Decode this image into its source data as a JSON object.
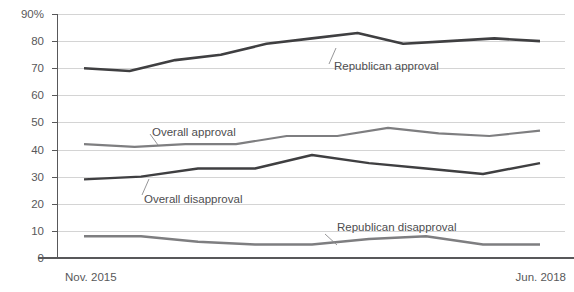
{
  "chart_data": {
    "type": "line",
    "title": "",
    "subtitle": "",
    "xlabel": "",
    "ylabel": "",
    "ylim": [
      0,
      90
    ],
    "yticks": [
      0,
      10,
      20,
      30,
      40,
      50,
      60,
      70,
      80,
      90
    ],
    "ytick_labels": [
      "0",
      "10",
      "20",
      "30",
      "40",
      "50",
      "60",
      "70",
      "80",
      "90%"
    ],
    "xtick_labels": [
      "Nov. 2015",
      "Jun. 2018"
    ],
    "x_range_start": "Nov. 2015",
    "x_range_end": "Jun. 2018",
    "grid": true,
    "legend_position": "inline-annotations",
    "colors": {
      "dark_series": "#3f3f41",
      "gray_series": "#7e7e80",
      "gridline": "#c9c9c9",
      "axis": "#58585a",
      "text": "#58585a"
    },
    "series": [
      {
        "name": "Republican approval",
        "color": "#3f3f41",
        "style": "dark",
        "values": [
          70,
          69,
          73,
          75,
          79,
          81,
          83,
          79,
          80,
          81,
          80
        ]
      },
      {
        "name": "Overall approval",
        "color": "#7e7e80",
        "style": "gray",
        "values": [
          42,
          41,
          42,
          42,
          45,
          45,
          48,
          46,
          45,
          47
        ]
      },
      {
        "name": "Overall disapproval",
        "color": "#3f3f41",
        "style": "dark",
        "values": [
          29,
          30,
          33,
          33,
          38,
          35,
          33,
          31,
          35
        ]
      },
      {
        "name": "Republican disapproval",
        "color": "#7e7e80",
        "style": "gray",
        "values": [
          8,
          8,
          6,
          5,
          5,
          7,
          8,
          5,
          5
        ]
      }
    ],
    "annotations": [
      {
        "text": "Republican approval",
        "series": "Republican approval"
      },
      {
        "text": "Overall approval",
        "series": "Overall approval"
      },
      {
        "text": "Overall disapproval",
        "series": "Overall disapproval"
      },
      {
        "text": "Republican disapproval",
        "series": "Republican disapproval"
      }
    ]
  },
  "axis": {
    "y_labels": {
      "t90": "90%",
      "t80": "80",
      "t70": "70",
      "t60": "60",
      "t50": "50",
      "t40": "40",
      "t30": "30",
      "t20": "20",
      "t10": "10",
      "t0": "0"
    },
    "x_labels": {
      "start": "Nov. 2015",
      "end": "Jun. 2018"
    }
  },
  "labels": {
    "republican_approval": "Republican approval",
    "overall_approval": "Overall approval",
    "overall_disapproval": "Overall disapproval",
    "republican_disapproval": "Republican disapproval"
  }
}
